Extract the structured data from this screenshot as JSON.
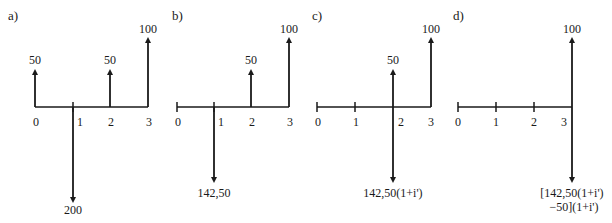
{
  "diagrams": [
    {
      "panel_label": "a)",
      "periods": [
        "0",
        "1",
        "2",
        "3"
      ],
      "flows": [
        {
          "period": 0,
          "direction": "up",
          "label": "50"
        },
        {
          "period": 1,
          "direction": "down",
          "label": "200"
        },
        {
          "period": 2,
          "direction": "up",
          "label": "50"
        },
        {
          "period": 3,
          "direction": "up",
          "label": "100"
        }
      ]
    },
    {
      "panel_label": "b)",
      "periods": [
        "0",
        "1",
        "2",
        "3"
      ],
      "flows": [
        {
          "period": 1,
          "direction": "down",
          "label": "142,50"
        },
        {
          "period": 2,
          "direction": "up",
          "label": "50"
        },
        {
          "period": 3,
          "direction": "up",
          "label": "100"
        }
      ]
    },
    {
      "panel_label": "c)",
      "periods": [
        "0",
        "1",
        "2",
        "3"
      ],
      "flows": [
        {
          "period": 2,
          "direction": "up",
          "label": "50"
        },
        {
          "period": 2,
          "direction": "down",
          "label": "142,50(1+i')"
        },
        {
          "period": 3,
          "direction": "up",
          "label": "100"
        }
      ]
    },
    {
      "panel_label": "d)",
      "periods": [
        "0",
        "1",
        "2",
        "3"
      ],
      "flows": [
        {
          "period": 3,
          "direction": "up",
          "label": "100"
        },
        {
          "period": 3,
          "direction": "down",
          "label_line1": "[142,50(1+i')",
          "label_line2": "−50](1+i')"
        }
      ]
    }
  ],
  "colors": {
    "ink": "#1a1a1a",
    "background": "#ffffff"
  }
}
